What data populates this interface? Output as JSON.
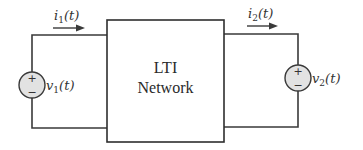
{
  "diagram": {
    "type": "two-port circuit",
    "block": {
      "line1": "LTI",
      "line2": "Network"
    },
    "left_port": {
      "current_label": "i",
      "current_sub": "1",
      "current_arg": "(t)",
      "source_label": "v",
      "source_sub": "1",
      "source_arg": "(t)",
      "plus": "+",
      "minus": "−"
    },
    "right_port": {
      "current_label": "i",
      "current_sub": "2",
      "current_arg": "(t)",
      "source_label": "v",
      "source_sub": "2",
      "source_arg": "(t)",
      "plus": "+",
      "minus": "−"
    },
    "colors": {
      "wire": "#3a3a3a",
      "source_fill": "#e2e2e2",
      "background": "#ffffff"
    }
  }
}
